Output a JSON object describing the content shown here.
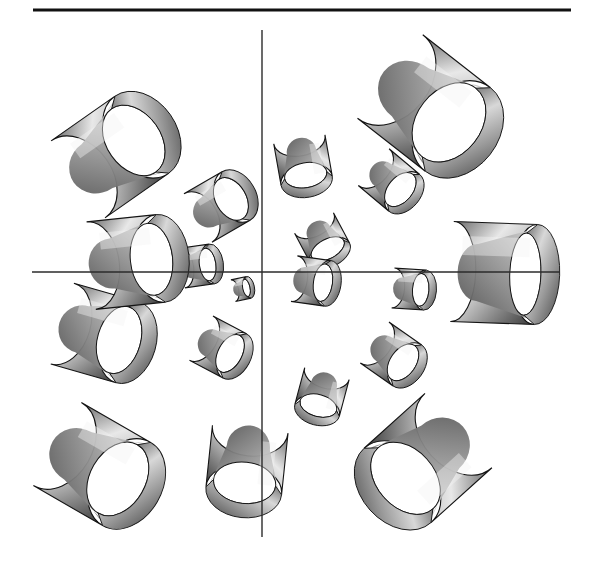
{
  "figure": {
    "title": "",
    "background_color": "#ffffff",
    "ink_color": "#1a1a1a",
    "width": 600,
    "height": 575,
    "rule": {
      "name": "top-horizontal-rule",
      "x1": 33,
      "y1": 10,
      "x2": 571,
      "y2": 10,
      "thickness": 3,
      "color": "#111111"
    },
    "axes": {
      "origin_x": 262,
      "origin_y": 272,
      "line_color": "#2b2b2b",
      "line_width": 1.4,
      "x_axis": {
        "name": "x-axis",
        "x1": 32,
        "y1": 272,
        "x2": 560,
        "y2": 272
      },
      "y_axis": {
        "name": "y-axis",
        "x1": 262,
        "y1": 30,
        "x2": 262,
        "y2": 537
      }
    },
    "shading": {
      "highlight": "#f2f2f2",
      "midtone": "#9b9b9b",
      "shadow": "#3d3d3d",
      "interior_shadow": "#6e6e6e",
      "outline": "#141414",
      "hole": "#ffffff"
    }
  },
  "chart_data": {
    "type": "scatter",
    "title": "",
    "subtitle": "",
    "xlabel": "",
    "ylabel": "",
    "grid": false,
    "legend": null,
    "annotations": [],
    "glyph": "open-tube",
    "axis_ranges": {
      "xlim": [
        -1,
        1
      ],
      "ylim": [
        -1,
        1
      ]
    },
    "units": "pixels",
    "tubes": [
      {
        "id": 1,
        "cx": 110,
        "cy": 157,
        "r": 47,
        "len": 78,
        "angle": -35,
        "tilt": 26
      },
      {
        "id": 2,
        "cx": 217,
        "cy": 207,
        "r": 28,
        "len": 44,
        "angle": -30,
        "tilt": 24
      },
      {
        "id": 3,
        "cx": 303,
        "cy": 160,
        "r": 26,
        "len": 42,
        "angle": 80,
        "tilt": 20
      },
      {
        "id": 4,
        "cx": 424,
        "cy": 103,
        "r": 53,
        "len": 86,
        "angle": 38,
        "tilt": 28
      },
      {
        "id": 5,
        "cx": 389,
        "cy": 180,
        "r": 24,
        "len": 40,
        "angle": 40,
        "tilt": 22
      },
      {
        "id": 6,
        "cx": 322,
        "cy": 238,
        "r": 22,
        "len": 34,
        "angle": 62,
        "tilt": 18
      },
      {
        "id": 7,
        "cx": 126,
        "cy": 262,
        "r": 44,
        "len": 70,
        "angle": -6,
        "tilt": 20
      },
      {
        "id": 8,
        "cx": 197,
        "cy": 266,
        "r": 20,
        "len": 30,
        "angle": -8,
        "tilt": 16
      },
      {
        "id": 9,
        "cx": 241,
        "cy": 289,
        "r": 11,
        "len": 16,
        "angle": -12,
        "tilt": 12
      },
      {
        "id": 10,
        "cx": 311,
        "cy": 281,
        "r": 23,
        "len": 34,
        "angle": 8,
        "tilt": 16
      },
      {
        "id": 11,
        "cx": 409,
        "cy": 289,
        "r": 20,
        "len": 32,
        "angle": 4,
        "tilt": 16
      },
      {
        "id": 12,
        "cx": 494,
        "cy": 273,
        "r": 50,
        "len": 84,
        "angle": 2,
        "tilt": 10
      },
      {
        "id": 13,
        "cx": 95,
        "cy": 333,
        "r": 42,
        "len": 68,
        "angle": 16,
        "tilt": 22
      },
      {
        "id": 14,
        "cx": 218,
        "cy": 347,
        "r": 25,
        "len": 38,
        "angle": 28,
        "tilt": 20
      },
      {
        "id": 15,
        "cx": 322,
        "cy": 392,
        "r": 23,
        "len": 38,
        "angle": 105,
        "tilt": 20
      },
      {
        "id": 16,
        "cx": 391,
        "cy": 354,
        "r": 25,
        "len": 40,
        "angle": 35,
        "tilt": 22
      },
      {
        "id": 17,
        "cx": 92,
        "cy": 464,
        "r": 48,
        "len": 80,
        "angle": 30,
        "tilt": 26
      },
      {
        "id": 18,
        "cx": 247,
        "cy": 460,
        "r": 38,
        "len": 62,
        "angle": 96,
        "tilt": 24
      },
      {
        "id": 19,
        "cx": 428,
        "cy": 458,
        "r": 50,
        "len": 82,
        "angle": 138,
        "tilt": 26
      }
    ]
  }
}
